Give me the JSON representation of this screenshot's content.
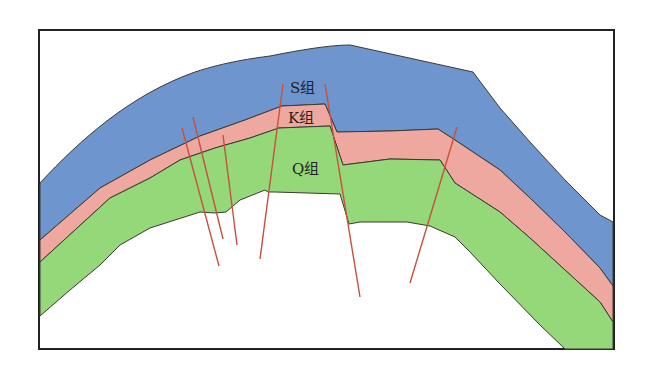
{
  "diagram": {
    "title": "",
    "type": "geological-cross-section-anticline-with-faults",
    "layers": [
      {
        "id": "S",
        "label": "S组",
        "color": "#6f95cf"
      },
      {
        "id": "K",
        "label": "K组",
        "color": "#eea8a0"
      },
      {
        "id": "Q",
        "label": "Q组",
        "color": "#94d87a"
      }
    ],
    "fault_color": "#c8503c",
    "boundary_color": "#3a3a30",
    "frame_color": "#222222",
    "fault_count": 7
  }
}
